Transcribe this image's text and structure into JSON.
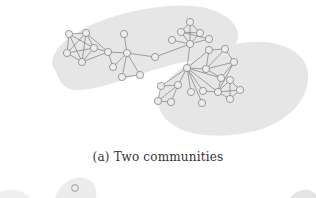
{
  "figure": {
    "caption": "(a) Two communities",
    "background": "#ffffff",
    "community_fill": "#e6e6e6",
    "node_fill": "#ececec",
    "node_stroke": "#7a7a7a",
    "edge_color": "#6a6a6a",
    "communities": [
      {
        "name": "community-left",
        "path": "M55,70 C40,50 90,12 170,6 C215,2 240,20 238,38 C236,52 210,58 185,62 C150,68 110,88 80,90 C62,91 60,80 55,70 Z"
      },
      {
        "name": "community-right",
        "path": "M160,110 C150,85 190,55 235,44 C275,36 305,50 308,72 C311,100 285,128 240,134 C200,140 168,130 160,110 Z"
      }
    ],
    "nodes": [
      {
        "id": "a1",
        "x": 69,
        "y": 34
      },
      {
        "id": "a2",
        "x": 86,
        "y": 33
      },
      {
        "id": "a3",
        "x": 67,
        "y": 53
      },
      {
        "id": "a4",
        "x": 82,
        "y": 62
      },
      {
        "id": "a5",
        "x": 94,
        "y": 48
      },
      {
        "id": "a6",
        "x": 108,
        "y": 52
      },
      {
        "id": "a7",
        "x": 124,
        "y": 34
      },
      {
        "id": "a8",
        "x": 127,
        "y": 53
      },
      {
        "id": "a9",
        "x": 113,
        "y": 67
      },
      {
        "id": "a10",
        "x": 122,
        "y": 77
      },
      {
        "id": "a11",
        "x": 140,
        "y": 75
      },
      {
        "id": "a12",
        "x": 155,
        "y": 57
      },
      {
        "id": "b1",
        "x": 190,
        "y": 22
      },
      {
        "id": "b2",
        "x": 181,
        "y": 32
      },
      {
        "id": "b3",
        "x": 200,
        "y": 33
      },
      {
        "id": "b4",
        "x": 172,
        "y": 40
      },
      {
        "id": "b5",
        "x": 209,
        "y": 39
      },
      {
        "id": "b6",
        "x": 190,
        "y": 44
      },
      {
        "id": "c1",
        "x": 209,
        "y": 50
      },
      {
        "id": "c2",
        "x": 225,
        "y": 49
      },
      {
        "id": "c3",
        "x": 234,
        "y": 62
      },
      {
        "id": "c4",
        "x": 206,
        "y": 69
      },
      {
        "id": "c5",
        "x": 221,
        "y": 78
      },
      {
        "id": "c6",
        "x": 187,
        "y": 68
      },
      {
        "id": "c7",
        "x": 178,
        "y": 85
      },
      {
        "id": "c8",
        "x": 161,
        "y": 86
      },
      {
        "id": "c9",
        "x": 171,
        "y": 102
      },
      {
        "id": "c10",
        "x": 158,
        "y": 101
      },
      {
        "id": "c11",
        "x": 191,
        "y": 92
      },
      {
        "id": "c12",
        "x": 203,
        "y": 91
      },
      {
        "id": "c13",
        "x": 202,
        "y": 103
      },
      {
        "id": "c14",
        "x": 230,
        "y": 80
      },
      {
        "id": "c15",
        "x": 240,
        "y": 90
      },
      {
        "id": "c16",
        "x": 230,
        "y": 99
      },
      {
        "id": "c17",
        "x": 218,
        "y": 92
      }
    ],
    "edges": [
      [
        "a1",
        "a2"
      ],
      [
        "a1",
        "a3"
      ],
      [
        "a1",
        "a5"
      ],
      [
        "a1",
        "a4"
      ],
      [
        "a2",
        "a3"
      ],
      [
        "a2",
        "a5"
      ],
      [
        "a2",
        "a4"
      ],
      [
        "a3",
        "a4"
      ],
      [
        "a3",
        "a5"
      ],
      [
        "a4",
        "a5"
      ],
      [
        "a5",
        "a6"
      ],
      [
        "a4",
        "a6"
      ],
      [
        "a2",
        "a6"
      ],
      [
        "a6",
        "a8"
      ],
      [
        "a6",
        "a9"
      ],
      [
        "a7",
        "a8"
      ],
      [
        "a8",
        "a9"
      ],
      [
        "a8",
        "a10"
      ],
      [
        "a8",
        "a11"
      ],
      [
        "a10",
        "a11"
      ],
      [
        "a8",
        "a12"
      ],
      [
        "a12",
        "b6"
      ],
      [
        "b1",
        "b2"
      ],
      [
        "b1",
        "b3"
      ],
      [
        "b2",
        "b3"
      ],
      [
        "b2",
        "b6"
      ],
      [
        "b3",
        "b6"
      ],
      [
        "b1",
        "b6"
      ],
      [
        "b2",
        "b5"
      ],
      [
        "b4",
        "b6"
      ],
      [
        "b5",
        "b6"
      ],
      [
        "b6",
        "c6"
      ],
      [
        "c1",
        "c2"
      ],
      [
        "c1",
        "c4"
      ],
      [
        "c1",
        "c6"
      ],
      [
        "c2",
        "c3"
      ],
      [
        "c2",
        "c4"
      ],
      [
        "c3",
        "c4"
      ],
      [
        "c3",
        "c5"
      ],
      [
        "c4",
        "c5"
      ],
      [
        "c6",
        "c4"
      ],
      [
        "c6",
        "c5"
      ],
      [
        "c6",
        "c7"
      ],
      [
        "c6",
        "c11"
      ],
      [
        "c6",
        "c12"
      ],
      [
        "c6",
        "c8"
      ],
      [
        "c7",
        "c8"
      ],
      [
        "c7",
        "c9"
      ],
      [
        "c8",
        "c10"
      ],
      [
        "c9",
        "c10"
      ],
      [
        "c7",
        "c10"
      ],
      [
        "c6",
        "c17"
      ],
      [
        "c5",
        "c17"
      ],
      [
        "c3",
        "c17"
      ],
      [
        "c12",
        "c17"
      ],
      [
        "c17",
        "c14"
      ],
      [
        "c14",
        "c15"
      ],
      [
        "c15",
        "c16"
      ],
      [
        "c16",
        "c17"
      ],
      [
        "c14",
        "c16"
      ],
      [
        "c17",
        "c15"
      ],
      [
        "c13",
        "c6"
      ]
    ]
  },
  "partial_next_figure": {
    "visible_node": {
      "x": 75,
      "y": 188
    },
    "blob_left": "M-10,198 C0,188 20,186 30,198 Z",
    "blob_center": "M55,198 C60,180 80,172 92,182 C98,188 96,198 96,198 Z",
    "blob_right": "M290,198 C300,186 314,188 318,198 Z"
  }
}
